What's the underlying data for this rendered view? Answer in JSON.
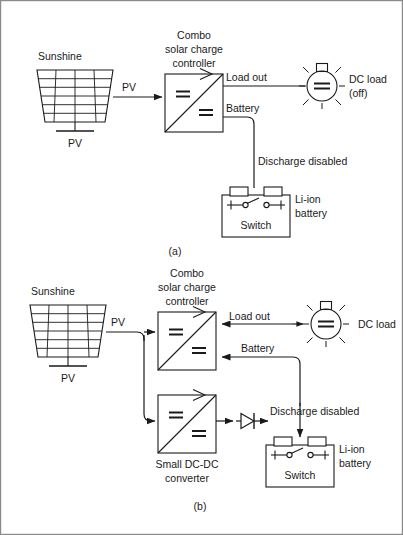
{
  "figure": {
    "title_implicit": "PV solar charge controller with Li-ion battery discharge disabled",
    "border_color": "#8a8a8a",
    "line_color": "#1a1a1a",
    "panels": [
      {
        "id": "a",
        "caption": "(a)",
        "labels": {
          "sunshine": "Sunshine",
          "pv_panel": "PV",
          "pv_wire": "PV",
          "controller": "Combo\nsolar charge\ncontroller",
          "controller_line1": "Combo",
          "controller_line2": "solar charge",
          "controller_line3": "controller",
          "load_out": "Load out",
          "battery": "Battery",
          "dc_load": "DC load",
          "dc_load_state": "(off)",
          "discharge": "Discharge disabled",
          "switch": "Switch",
          "li_ion": "Li-ion",
          "battery_word": "battery"
        },
        "flow": {
          "pv_to_controller": "right",
          "load_out_direction": "none",
          "battery_direction": "none",
          "lamp_state": "off",
          "diode_present": false
        }
      },
      {
        "id": "b",
        "caption": "(b)",
        "labels": {
          "sunshine": "Sunshine",
          "pv_panel": "PV",
          "pv_wire": "PV",
          "controller_line1": "Combo",
          "controller_line2": "solar charge",
          "controller_line3": "controller",
          "converter_line1": "Small DC-DC",
          "converter_line2": "converter",
          "load_out": "Load out",
          "battery": "Battery",
          "dc_load": "DC load",
          "discharge": "Discharge disabled",
          "switch": "Switch",
          "li_ion": "Li-ion",
          "battery_word": "battery"
        },
        "flow": {
          "pv_to_controller": "right-branching",
          "load_out_direction": "left",
          "battery_direction": "left",
          "lamp_state": "on",
          "diode_present": true
        }
      }
    ],
    "symbols": {
      "converter_box": "dc-dc-converter-symbol",
      "dc_symbol": "dc-double-bar",
      "lamp": "lamp-symbol",
      "battery": "battery-symbol",
      "switch": "switch-open-symbol",
      "diode": "diode-symbol",
      "pv_panel": "pv-panel-symbol"
    }
  }
}
